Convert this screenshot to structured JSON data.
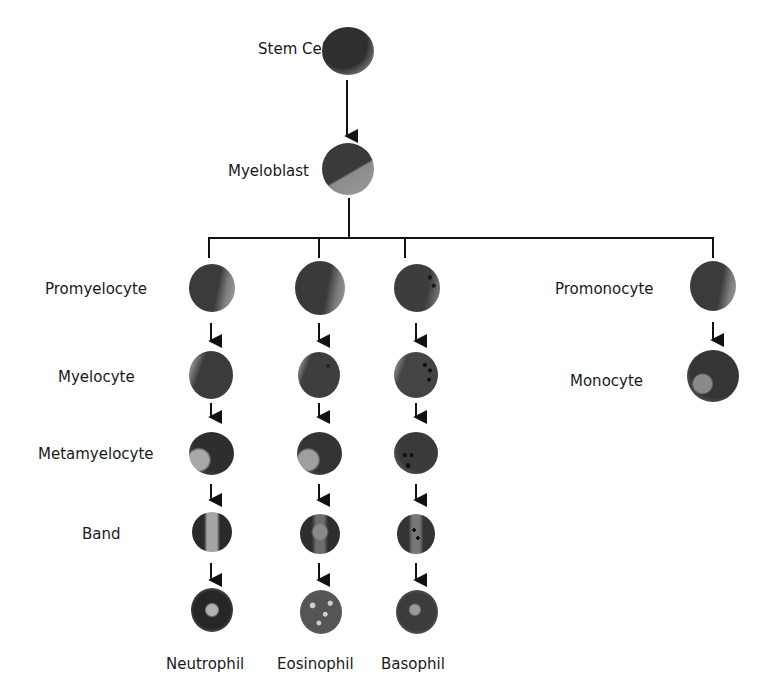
{
  "diagram": {
    "colors": {
      "line": "#111111",
      "cell_dark": "#3a3a3a",
      "cell_mid": "#5a5a5a",
      "cell_light": "#9a9a9a",
      "granule": "#161616"
    },
    "root_nodes": [
      {
        "id": "stem-cell",
        "label": "Stem Cell"
      },
      {
        "id": "myeloblast",
        "label": "Myeloblast"
      }
    ],
    "row_labels": {
      "promyelocyte": "Promyelocyte",
      "myelocyte": "Myelocyte",
      "metamyelocyte": "Metamyelocyte",
      "band": "Band"
    },
    "monocyte_branch": {
      "promonocyte": "Promonocyte",
      "monocyte": "Monocyte"
    },
    "terminal_labels": {
      "neutrophil": "Neutrophil",
      "eosinophil": "Eosinophil",
      "basophil": "Basophil"
    },
    "lineages": [
      {
        "name": "Neutrophil",
        "stages": [
          "Promyelocyte",
          "Myelocyte",
          "Metamyelocyte",
          "Band",
          "Neutrophil"
        ]
      },
      {
        "name": "Eosinophil",
        "stages": [
          "Promyelocyte",
          "Myelocyte",
          "Metamyelocyte",
          "Band",
          "Eosinophil"
        ]
      },
      {
        "name": "Basophil",
        "stages": [
          "Promyelocyte",
          "Myelocyte",
          "Metamyelocyte",
          "Band",
          "Basophil"
        ]
      },
      {
        "name": "Monocyte",
        "stages": [
          "Promonocyte",
          "Monocyte"
        ]
      }
    ],
    "edges": [
      [
        "Stem Cell",
        "Myeloblast"
      ],
      [
        "Myeloblast",
        "Promyelocyte (neutrophil)"
      ],
      [
        "Myeloblast",
        "Promyelocyte (eosinophil)"
      ],
      [
        "Myeloblast",
        "Promyelocyte (basophil)"
      ],
      [
        "Myeloblast",
        "Promonocyte"
      ],
      [
        "Promonocyte",
        "Monocyte"
      ]
    ]
  }
}
